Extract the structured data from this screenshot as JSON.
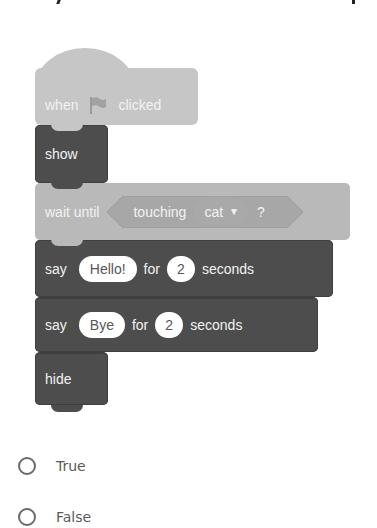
{
  "script": {
    "hat_block": {
      "text_before": "when",
      "icon": "green-flag-icon",
      "text_after": "clicked"
    },
    "show_block": {
      "label": "show"
    },
    "wait_block": {
      "label": "wait until",
      "condition": {
        "label": "touching",
        "dropdown_value": "cat",
        "suffix": "?"
      }
    },
    "say_block_1": {
      "label": "say",
      "message": "Hello!",
      "for_label": "for",
      "seconds": "2",
      "unit_label": "seconds"
    },
    "say_block_2": {
      "label": "say",
      "message": "Bye",
      "for_label": "for",
      "seconds": "2",
      "unit_label": "seconds"
    },
    "hide_block": {
      "label": "hide"
    }
  },
  "answers": {
    "options": [
      {
        "label": "True",
        "selected": false
      },
      {
        "label": "False",
        "selected": false
      }
    ]
  },
  "colors": {
    "events_block": "#c6c6c6",
    "looks_block": "#4d4d4d",
    "control_block": "#b9b9b9",
    "radio_border": "#6a6a6a"
  }
}
